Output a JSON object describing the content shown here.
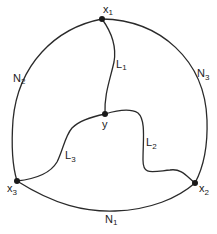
{
  "diagram": {
    "colors": {
      "stroke": "#2a2a2a",
      "node": "#1a1a1a",
      "text": "#222222",
      "background": "#ffffff"
    },
    "nodes": [
      {
        "id": "x1",
        "label": "x",
        "sub": "1"
      },
      {
        "id": "x2",
        "label": "x",
        "sub": "2"
      },
      {
        "id": "x3",
        "label": "x",
        "sub": "3"
      },
      {
        "id": "y",
        "label": "y",
        "sub": ""
      }
    ],
    "outer_arcs": [
      {
        "id": "N1",
        "label": "N",
        "sub": "1",
        "from": "x3",
        "to": "x2"
      },
      {
        "id": "N2",
        "label": "N",
        "sub": "2",
        "from": "x3",
        "to": "x1"
      },
      {
        "id": "N3",
        "label": "N",
        "sub": "3",
        "from": "x1",
        "to": "x2"
      }
    ],
    "inner_paths": [
      {
        "id": "L1",
        "label": "L",
        "sub": "1",
        "from": "x1",
        "to": "y"
      },
      {
        "id": "L2",
        "label": "L",
        "sub": "2",
        "from": "y",
        "to": "x2"
      },
      {
        "id": "L3",
        "label": "L",
        "sub": "3",
        "from": "y",
        "to": "x3"
      }
    ]
  }
}
